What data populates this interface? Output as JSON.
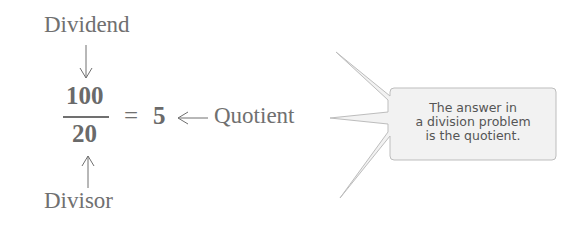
{
  "labels": {
    "dividend": "Dividend",
    "divisor": "Divisor",
    "quotient": "Quotient"
  },
  "expression": {
    "numerator": "100",
    "denominator": "20",
    "equals": "=",
    "result": "5"
  },
  "callout": {
    "lines": [
      "The answer in",
      "a division problem",
      "is the quotient."
    ]
  },
  "colors": {
    "text": "#707070",
    "callout_fill": "#f2f2f2",
    "callout_stroke": "#bdbdbd"
  }
}
